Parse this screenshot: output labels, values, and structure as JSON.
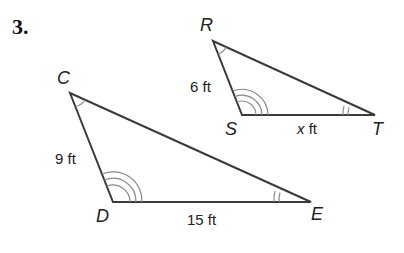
{
  "problem": {
    "number": "3."
  },
  "colors": {
    "line": "#3a3a3a",
    "arc": "#8a8a8a",
    "text": "#222222"
  },
  "triangle_large": {
    "vertices": {
      "C": "C",
      "D": "D",
      "E": "E"
    },
    "sides": {
      "CD": "9 ft",
      "DE": "15 ft"
    }
  },
  "triangle_small": {
    "vertices": {
      "R": "R",
      "S": "S",
      "T": "T"
    },
    "sides": {
      "RS": "6 ft",
      "ST_var": "x",
      "ST_unit": " ft"
    }
  }
}
